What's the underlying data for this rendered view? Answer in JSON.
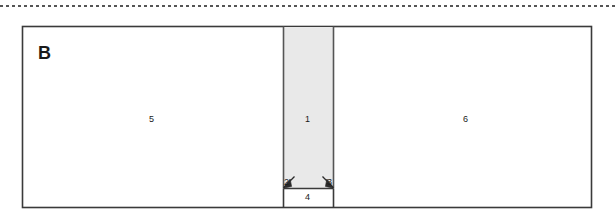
{
  "figure": {
    "panel_letter": "B",
    "background_color": "#ffffff",
    "line_color": "#3a3a3a",
    "shaded_fill": "#e9e9e9",
    "text_color": "#1a1a1a",
    "top_divider": {
      "name": "dashed-separator",
      "style": "dashed",
      "color": "#555555"
    },
    "outer_frame": {
      "name": "outer-rectangle",
      "x": 22,
      "y": 26,
      "width": 570,
      "height": 182
    },
    "regions": [
      {
        "id": "left-region",
        "label": "5",
        "label_x": 152,
        "label_y": 119,
        "fill": "#ffffff"
      },
      {
        "id": "center-column",
        "label": "1",
        "label_x": 307,
        "label_y": 119,
        "fill": "#e9e9e9"
      },
      {
        "id": "right-region",
        "label": "6",
        "label_x": 466,
        "label_y": 119,
        "fill": "#ffffff"
      }
    ],
    "bottom_box": {
      "id": "bottom-box",
      "label": "4",
      "label_x": 307,
      "label_y": 198,
      "fill": "#ffffff"
    },
    "callouts": [
      {
        "id": "callout-left",
        "label": "2",
        "label_x": 286,
        "label_y": 184
      },
      {
        "id": "callout-right",
        "label": "3",
        "label_x": 329,
        "label_y": 184
      }
    ]
  }
}
